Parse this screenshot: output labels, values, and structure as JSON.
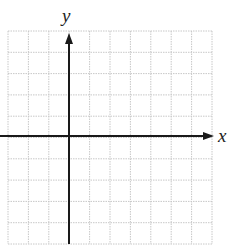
{
  "diagram": {
    "type": "coordinate-plane",
    "x_axis_label": "x",
    "y_axis_label": "y",
    "grid": {
      "columns": 10,
      "rows": 10,
      "left": 8,
      "top": 31,
      "right": 212,
      "bottom": 244,
      "line_color": "#c8c8c8",
      "line_style": "dotted"
    },
    "axes": {
      "x_axis_y": 136,
      "y_axis_x": 69,
      "color": "#1a1a1a",
      "x_arrow_tip": 214,
      "y_arrow_tip": 33
    }
  }
}
